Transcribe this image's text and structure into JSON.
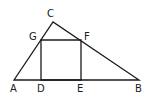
{
  "diagram": {
    "points": {
      "A": {
        "label": "A",
        "x": 14,
        "y": 80
      },
      "B": {
        "label": "B",
        "x": 139,
        "y": 80
      },
      "C": {
        "label": "C",
        "x": 53,
        "y": 22
      },
      "D": {
        "label": "D",
        "x": 41,
        "y": 80
      },
      "E": {
        "label": "E",
        "x": 81,
        "y": 80
      },
      "F": {
        "label": "F",
        "x": 81,
        "y": 40
      },
      "G": {
        "label": "G",
        "x": 41,
        "y": 40
      }
    },
    "labels": {
      "A": "A",
      "B": "B",
      "C": "C",
      "D": "D",
      "E": "E",
      "F": "F",
      "G": "G"
    },
    "colors": {
      "stroke": "#1a1a1a",
      "background": "#ffffff"
    }
  }
}
